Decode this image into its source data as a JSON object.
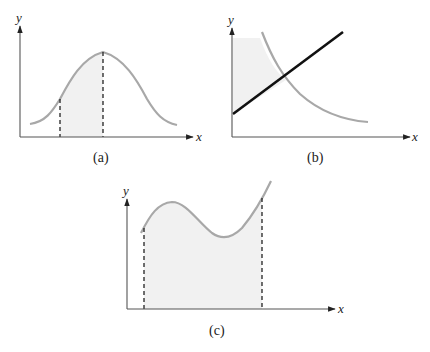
{
  "panels": [
    {
      "id": "a",
      "caption": "(a)",
      "x_axis_label": "x",
      "y_axis_label": "y",
      "description": "Bell-shaped curve with shaded region between two dashed verticals; right dashed line at the peak"
    },
    {
      "id": "b",
      "caption": "(b)",
      "x_axis_label": "x",
      "y_axis_label": "y",
      "description": "Decreasing gray curve crossing an increasing black line; region between y-axis and curve shaded"
    },
    {
      "id": "c",
      "caption": "(c)",
      "x_axis_label": "x",
      "y_axis_label": "y",
      "description": "Curve with local max and local min, shaded area under curve between two dashed verticals"
    }
  ],
  "colors": {
    "curve": "#a8a8a8",
    "line": "#111111",
    "shade": "#f1f1f1",
    "axis": "#555555"
  }
}
